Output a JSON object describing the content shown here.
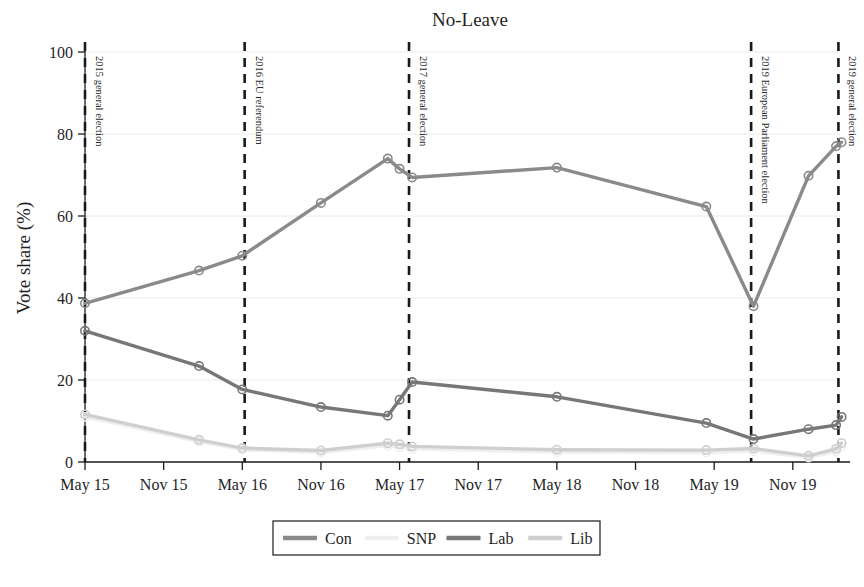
{
  "chart_data": {
    "type": "line",
    "title": "No-Leave",
    "xlabel": "",
    "ylabel": "Vote share (%)",
    "ylim": [
      0,
      100
    ],
    "yticks": [
      0,
      20,
      40,
      60,
      80,
      100
    ],
    "ytick_labels": [
      "0",
      "20",
      "40",
      "60",
      "80",
      "100"
    ],
    "xtick_labels": [
      "May 15",
      "Nov 15",
      "May 16",
      "Nov 16",
      "May 17",
      "Nov 17",
      "May 18",
      "Nov 18",
      "May 19",
      "Nov 19"
    ],
    "xlim": [
      0,
      9.6
    ],
    "grid": "horizontal-faint",
    "legend_position": "bottom-center",
    "legend": [
      "Con",
      "SNP",
      "Lab",
      "Lib"
    ],
    "colors": {
      "Con": "#8a8a8a",
      "SNP": "#efefef",
      "Lab": "#777777",
      "Lib": "#cfcfcf"
    },
    "series": [
      {
        "name": "Con",
        "color": "#8a8a8a",
        "points": [
          {
            "x": 0.0,
            "y": 38.7
          },
          {
            "x": 1.45,
            "y": 46.7
          },
          {
            "x": 2.0,
            "y": 50.3
          },
          {
            "x": 3.0,
            "y": 63.2
          },
          {
            "x": 3.85,
            "y": 74.0
          },
          {
            "x": 4.0,
            "y": 71.5
          },
          {
            "x": 4.16,
            "y": 69.4
          },
          {
            "x": 6.0,
            "y": 71.8
          },
          {
            "x": 7.9,
            "y": 62.3
          },
          {
            "x": 8.5,
            "y": 38.0
          },
          {
            "x": 9.2,
            "y": 69.8
          },
          {
            "x": 9.55,
            "y": 77.0
          },
          {
            "x": 9.62,
            "y": 78.0
          }
        ]
      },
      {
        "name": "Lab",
        "color": "#777777",
        "points": [
          {
            "x": 0.0,
            "y": 32.0
          },
          {
            "x": 1.45,
            "y": 23.4
          },
          {
            "x": 2.0,
            "y": 17.7
          },
          {
            "x": 3.0,
            "y": 13.4
          },
          {
            "x": 3.85,
            "y": 11.3
          },
          {
            "x": 4.0,
            "y": 15.2
          },
          {
            "x": 4.16,
            "y": 19.5
          },
          {
            "x": 6.0,
            "y": 15.9
          },
          {
            "x": 7.9,
            "y": 9.5
          },
          {
            "x": 8.5,
            "y": 5.6
          },
          {
            "x": 9.2,
            "y": 8.0
          },
          {
            "x": 9.55,
            "y": 9.0
          },
          {
            "x": 9.62,
            "y": 11.0
          }
        ]
      },
      {
        "name": "Lib",
        "color": "#cfcfcf",
        "points": [
          {
            "x": 0.0,
            "y": 11.6
          },
          {
            "x": 1.45,
            "y": 5.4
          },
          {
            "x": 2.0,
            "y": 3.4
          },
          {
            "x": 3.0,
            "y": 2.8
          },
          {
            "x": 3.85,
            "y": 4.6
          },
          {
            "x": 4.0,
            "y": 4.3
          },
          {
            "x": 4.16,
            "y": 3.8
          },
          {
            "x": 6.0,
            "y": 3.0
          },
          {
            "x": 7.9,
            "y": 2.9
          },
          {
            "x": 8.5,
            "y": 3.3
          },
          {
            "x": 9.2,
            "y": 1.5
          },
          {
            "x": 9.55,
            "y": 3.2
          },
          {
            "x": 9.62,
            "y": 4.6
          }
        ]
      },
      {
        "name": "SNP",
        "color": "#efefef",
        "points": [
          {
            "x": 0.0,
            "y": 11.0
          },
          {
            "x": 1.45,
            "y": 5.0
          },
          {
            "x": 2.0,
            "y": 3.0
          },
          {
            "x": 3.0,
            "y": 2.3
          },
          {
            "x": 3.85,
            "y": 4.0
          },
          {
            "x": 4.0,
            "y": 3.6
          },
          {
            "x": 4.16,
            "y": 3.2
          },
          {
            "x": 6.0,
            "y": 2.4
          },
          {
            "x": 7.9,
            "y": 2.3
          },
          {
            "x": 8.5,
            "y": 2.7
          },
          {
            "x": 9.2,
            "y": 1.1
          },
          {
            "x": 9.55,
            "y": 2.6
          },
          {
            "x": 9.62,
            "y": 3.8
          }
        ]
      }
    ],
    "event_lines": [
      {
        "label": "2015 general election",
        "x": 0.0
      },
      {
        "label": "2016 EU referendum",
        "x": 2.03
      },
      {
        "label": "2017 general election",
        "x": 4.12
      },
      {
        "label": "2019 European Parliament election",
        "x": 8.47
      },
      {
        "label": "2019 general election",
        "x": 9.58
      }
    ]
  }
}
